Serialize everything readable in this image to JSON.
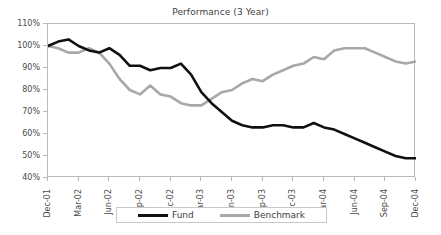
{
  "chart_data": {
    "type": "line",
    "title": "Performance (3 Year)",
    "xlabel": "",
    "ylabel": "",
    "ylim": [
      40,
      110
    ],
    "ytick_labels": [
      "110%",
      "100%",
      "90%",
      "80%",
      "70%",
      "60%",
      "50%",
      "40%"
    ],
    "ytick_values": [
      110,
      100,
      90,
      80,
      70,
      60,
      50,
      40
    ],
    "grid": false,
    "legend_position": "bottom",
    "categories": [
      "Dec-01",
      "Jan-02",
      "Feb-02",
      "Mar-02",
      "Apr-02",
      "May-02",
      "Jun-02",
      "Jul-02",
      "Aug-02",
      "Sep-02",
      "Oct-02",
      "Nov-02",
      "Dec-02",
      "Jan-03",
      "Feb-03",
      "Mar-03",
      "Apr-03",
      "May-03",
      "Jun-03",
      "Jul-03",
      "Aug-03",
      "Sep-03",
      "Oct-03",
      "Nov-03",
      "Dec-03",
      "Jan-04",
      "Feb-04",
      "Mar-04",
      "Apr-04",
      "May-04",
      "Jun-04",
      "Jul-04",
      "Aug-04",
      "Sep-04",
      "Oct-04",
      "Nov-04",
      "Dec-04"
    ],
    "xtick_labels": [
      "Dec-01",
      "Mar-02",
      "Jun-02",
      "Sep-02",
      "Dec-02",
      "Mar-03",
      "Jun-03",
      "Sep-03",
      "Dec-03",
      "Mar-04",
      "Jun-04",
      "Sep-04",
      "Dec-04"
    ],
    "xtick_indices": [
      0,
      3,
      6,
      9,
      12,
      15,
      18,
      21,
      24,
      27,
      30,
      33,
      36
    ],
    "series": [
      {
        "name": "Fund",
        "color": "#101010",
        "width": 2.6,
        "values": [
          100,
          102,
          103,
          100,
          98,
          97,
          99,
          96,
          91,
          91,
          89,
          90,
          90,
          92,
          87,
          79,
          74,
          70,
          66,
          64,
          63,
          63,
          64,
          64,
          63,
          63,
          65,
          63,
          62,
          60,
          58,
          56,
          54,
          52,
          50,
          49,
          49
        ]
      },
      {
        "name": "Benchmark",
        "color": "#a8a8a8",
        "width": 2.6,
        "values": [
          100,
          99,
          97,
          97,
          99,
          97,
          92,
          85,
          80,
          78,
          82,
          78,
          77,
          74,
          73,
          73,
          76,
          79,
          80,
          83,
          85,
          84,
          87,
          89,
          91,
          92,
          95,
          94,
          98,
          99,
          99,
          99,
          97,
          95,
          93,
          92,
          93
        ]
      }
    ]
  },
  "legend": {
    "items": [
      {
        "label": "Fund",
        "color": "#101010"
      },
      {
        "label": "Benchmark",
        "color": "#a8a8a8"
      }
    ]
  },
  "colors": {
    "fund": "#101010",
    "benchmark": "#a8a8a8",
    "frame": "#b9b9b9",
    "text": "#4a4a4a",
    "background": "#ffffff"
  }
}
